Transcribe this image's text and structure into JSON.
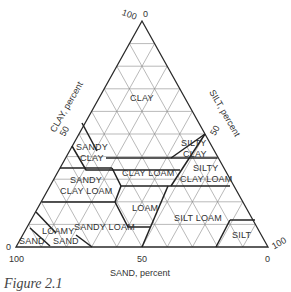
{
  "diagram": {
    "axes": {
      "clay": {
        "label": "CLAY, percent",
        "ticks": [
          "100",
          "50",
          "0"
        ]
      },
      "silt": {
        "label": "SILT, percent",
        "ticks": [
          "0",
          "50",
          "100"
        ]
      },
      "sand": {
        "label": "SAND, percent",
        "ticks": [
          "100",
          "50",
          "0"
        ]
      }
    },
    "top_ticks": {
      "left": "100",
      "right": "0"
    },
    "classes": [
      {
        "name": "CLAY",
        "lines": [
          "CLAY"
        ]
      },
      {
        "name": "SANDY CLAY",
        "lines": [
          "SANDY",
          "CLAY"
        ]
      },
      {
        "name": "SILTY CLAY",
        "lines": [
          "SILTY",
          "CLAY"
        ]
      },
      {
        "name": "CLAY LOAM",
        "lines": [
          "CLAY LOAM"
        ]
      },
      {
        "name": "SILTY CLAY LOAM",
        "lines": [
          "SILTY",
          "CLAY LOAM"
        ]
      },
      {
        "name": "SANDY CLAY LOAM",
        "lines": [
          "SANDY",
          "CLAY LOAM"
        ]
      },
      {
        "name": "LOAM",
        "lines": [
          "LOAM"
        ]
      },
      {
        "name": "SILT LOAM",
        "lines": [
          "SILT LOAM"
        ]
      },
      {
        "name": "SANDY LOAM",
        "lines": [
          "SANDY LOAM"
        ]
      },
      {
        "name": "LOAMY SAND",
        "lines": [
          "LOAMY",
          "SAND"
        ]
      },
      {
        "name": "SAND",
        "lines": [
          "SAND"
        ]
      },
      {
        "name": "SILT",
        "lines": [
          "SILT"
        ]
      }
    ],
    "caption": "Figure 2.1"
  },
  "colors": {
    "line": "#2a2a2a",
    "grid": "#8a8a8a",
    "text": "#333333"
  }
}
